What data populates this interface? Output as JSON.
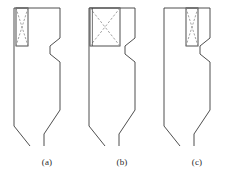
{
  "figure": {
    "background_color": "#ffffff",
    "line_color": "#3a3a3a",
    "dashed_color": "#8a8a8a",
    "line_width": 0.9,
    "canvas": {
      "width": 229,
      "height": 177
    }
  },
  "panels": [
    {
      "id": "a",
      "caption": "(a)",
      "origin_x": 14,
      "outline_points": "0,8 46,8 46,38 36,46 36,54 46,62 46,110 30,134 30,146",
      "outline_left_points": "0,8 0,126 16,146",
      "inset": {
        "name": "narrow-left-slot",
        "x": 2,
        "y": 8,
        "width": 12,
        "height": 38,
        "diagonals": "dashed-x"
      }
    },
    {
      "id": "b",
      "caption": "(b)",
      "origin_x": 89,
      "outline_points": "0,8 46,8 46,38 36,46 36,54 46,62 46,110 30,134 30,146",
      "outline_left_points": "0,8 0,126 16,146",
      "inset": {
        "name": "wide-slot",
        "x": 1,
        "y": 8,
        "width": 30,
        "height": 38,
        "diagonals": "dashed-x"
      }
    },
    {
      "id": "c",
      "caption": "(c)",
      "origin_x": 164,
      "outline_points": "0,8 46,8 46,38 36,46 36,54 46,62 46,110 30,134 30,146",
      "outline_left_points": "0,8 0,126 16,146",
      "inset": {
        "name": "narrow-right-slot",
        "x": 22,
        "y": 8,
        "width": 12,
        "height": 38,
        "diagonals": "dashed-x"
      }
    }
  ]
}
